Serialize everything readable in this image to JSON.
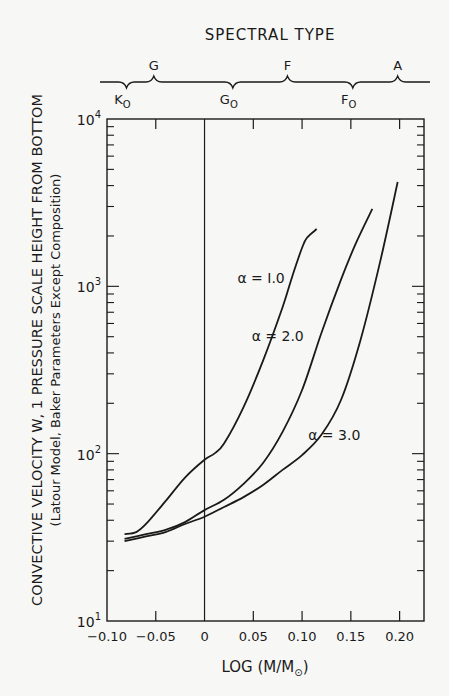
{
  "chart_data": {
    "type": "line",
    "title": "",
    "top_axis": {
      "label": "SPECTRAL TYPE",
      "marks_above": [
        {
          "label": "G",
          "x": -0.052
        },
        {
          "label": "F",
          "x": 0.085
        },
        {
          "label": "A",
          "x": 0.198
        }
      ],
      "marks_below": [
        {
          "label": "K",
          "sub": "O",
          "x": -0.08
        },
        {
          "label": "G",
          "sub": "O",
          "x": 0.029
        },
        {
          "label": "F",
          "sub": "O",
          "x": 0.152
        }
      ]
    },
    "xlabel": "LOG (M/M",
    "xlabel_sub": "⊙",
    "xlabel_end": ")",
    "ylabel": "CONVECTIVE VELOCITY W, 1 PRESSURE SCALE HEIGHT FROM BOTTOM",
    "ylabel2": "(Latour Model, Baker Parameters Except Composition)",
    "xlim": [
      -0.1,
      0.225
    ],
    "ylim": [
      10,
      10000
    ],
    "yscale": "log",
    "x_ticks": [
      -0.1,
      -0.05,
      0,
      0.05,
      0.1,
      0.15,
      0.2
    ],
    "x_tick_labels": [
      "−0.10",
      "−0.05",
      "0",
      "0.05",
      "0.10",
      "0.15",
      "0.20"
    ],
    "y_tick_labels": [
      {
        "base": "10",
        "exp": "1",
        "value": 10
      },
      {
        "base": "10",
        "exp": "2",
        "value": 100
      },
      {
        "base": "10",
        "exp": "3",
        "value": 1000
      },
      {
        "base": "10",
        "exp": "4",
        "value": 10000
      }
    ],
    "vertical_reference_line": 0,
    "grid": false,
    "series": [
      {
        "name": "α = 1.0",
        "label": "α = I.0",
        "x": [
          -0.082,
          -0.07,
          -0.06,
          -0.04,
          -0.02,
          0.0,
          0.01,
          0.02,
          0.04,
          0.06,
          0.08,
          0.09,
          0.1,
          0.105,
          0.115
        ],
        "y": [
          33,
          34,
          38,
          52,
          72,
          92,
          100,
          115,
          190,
          360,
          750,
          1150,
          1700,
          1950,
          2200
        ]
      },
      {
        "name": "α = 2.0",
        "label": "α = 2.0",
        "x": [
          -0.082,
          -0.06,
          -0.04,
          -0.02,
          0.0,
          0.02,
          0.04,
          0.06,
          0.08,
          0.1,
          0.12,
          0.14,
          0.155,
          0.172
        ],
        "y": [
          31,
          33,
          35,
          39,
          46,
          53,
          66,
          88,
          135,
          240,
          530,
          1100,
          1800,
          2900
        ]
      },
      {
        "name": "α = 3.0",
        "label": "α = 3.0",
        "x": [
          -0.082,
          -0.06,
          -0.04,
          -0.02,
          0.0,
          0.02,
          0.04,
          0.06,
          0.08,
          0.1,
          0.12,
          0.14,
          0.16,
          0.18,
          0.198
        ],
        "y": [
          30,
          32,
          34,
          38,
          42,
          48,
          55,
          65,
          80,
          98,
          130,
          210,
          480,
          1400,
          4200
        ]
      }
    ],
    "series_label_positions": [
      {
        "x": 0.058,
        "y": 1050
      },
      {
        "x": 0.075,
        "y": 470
      },
      {
        "x": 0.133,
        "y": 120
      }
    ]
  }
}
